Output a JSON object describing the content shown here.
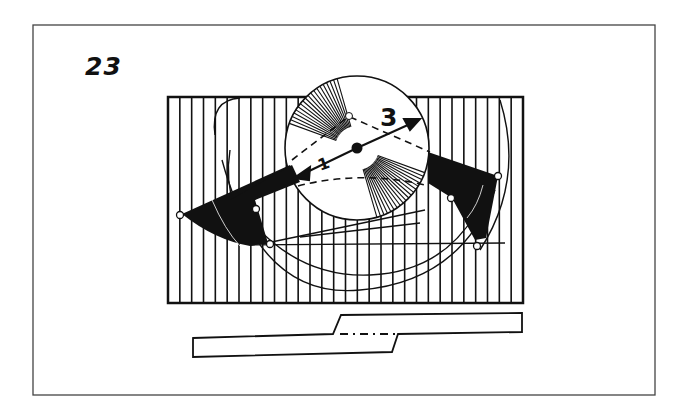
{
  "figure": {
    "number": "23",
    "labels": {
      "arrow_long": "3",
      "arrow_short": "1"
    }
  },
  "colors": {
    "ink": "#111111",
    "paper": "#ffffff",
    "frame": "#444444"
  },
  "geometry": {
    "frame": {
      "x": 33,
      "y": 25,
      "w": 622,
      "h": 370
    },
    "striped_rect": {
      "x": 168,
      "y": 97,
      "w": 355,
      "h": 206,
      "stripe_count": 30
    },
    "circle": {
      "cx": 357,
      "cy": 148,
      "r": 72
    },
    "center_dot": {
      "cx": 357,
      "cy": 148,
      "r": 5
    },
    "bar": {
      "y_top": 313,
      "y_bottom": 357
    }
  }
}
